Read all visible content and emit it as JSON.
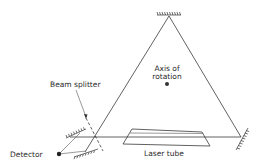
{
  "diagram": {
    "type": "ring-laser-gyroscope schematic",
    "labels": {
      "axis_line1": "Axis of",
      "axis_line2": "rotation",
      "beam_splitter": "Beam splitter",
      "detector": "Detector",
      "laser_tube": "Laser tube"
    },
    "components": [
      {
        "name": "top-mirror",
        "kind": "mirror"
      },
      {
        "name": "right-mirror",
        "kind": "mirror"
      },
      {
        "name": "left-upper-mirror",
        "kind": "mirror"
      },
      {
        "name": "left-lower-mirror",
        "kind": "mirror"
      },
      {
        "name": "beam-splitter",
        "kind": "dashed-line"
      },
      {
        "name": "laser-tube",
        "kind": "parallelogram"
      },
      {
        "name": "axis-of-rotation",
        "kind": "dot"
      },
      {
        "name": "detector",
        "kind": "dot"
      }
    ],
    "colors": {
      "ink": "#333333",
      "background": "#ffffff"
    }
  }
}
